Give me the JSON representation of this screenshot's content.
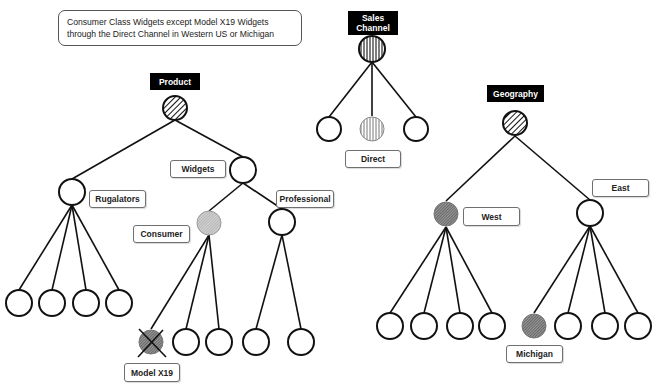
{
  "query": {
    "line1": "Consumer Class Widgets except Model X19 Widgets",
    "line2": "through the Direct Channel in Western US or Michigan"
  },
  "dimensions": {
    "product": {
      "title": "Product",
      "nodes": {
        "rugalators": "Rugalators",
        "widgets": "Widgets",
        "consumer": "Consumer",
        "professional": "Professional",
        "model_x19": "Model X19"
      }
    },
    "sales_channel": {
      "title_line1": "Sales",
      "title_line2": "Channel",
      "nodes": {
        "direct": "Direct"
      }
    },
    "geography": {
      "title": "Geography",
      "nodes": {
        "west": "West",
        "east": "East",
        "michigan": "Michigan"
      }
    }
  },
  "legend_semantics": {
    "diagonal_hatch": "dimension root",
    "vertical_hatch": "selected channel",
    "light_shade": "selected member",
    "dark_shade": "selected member",
    "crossed": "excluded member"
  },
  "colors": {
    "line": "#111111",
    "label_bg": "#000000",
    "label_text": "#ffffff",
    "shade_light": "#bdbdbd",
    "shade_dark": "#6a6a6a"
  }
}
